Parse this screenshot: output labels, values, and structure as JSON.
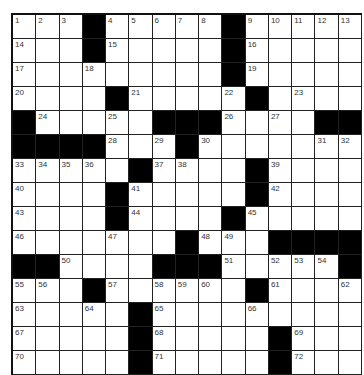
{
  "puzzle": {
    "rows": 15,
    "cols": 15,
    "colors": {
      "block": "#000000",
      "cell": "#ffffff",
      "line": "#222222",
      "number": "#333333"
    },
    "layout": [
      "...#.....#.....",
      "...#.....#.....",
      ".........#.....",
      "....#.....#....",
      "#.....###....##",
      "####...#.......",
      ".....#....#....",
      "....#.....#....",
      "....#....#.....",
      ".......#...####",
      "##....###.....#",
      "...#......#....",
      ".....#.........",
      ".....#.....#...",
      ".....#.....#..."
    ],
    "numbers": [
      {
        "r": 0,
        "c": 0,
        "n": "1"
      },
      {
        "r": 0,
        "c": 1,
        "n": "2"
      },
      {
        "r": 0,
        "c": 2,
        "n": "3"
      },
      {
        "r": 0,
        "c": 4,
        "n": "4"
      },
      {
        "r": 0,
        "c": 5,
        "n": "5"
      },
      {
        "r": 0,
        "c": 6,
        "n": "6"
      },
      {
        "r": 0,
        "c": 7,
        "n": "7"
      },
      {
        "r": 0,
        "c": 8,
        "n": "8"
      },
      {
        "r": 0,
        "c": 10,
        "n": "9"
      },
      {
        "r": 0,
        "c": 11,
        "n": "10"
      },
      {
        "r": 0,
        "c": 12,
        "n": "11"
      },
      {
        "r": 0,
        "c": 13,
        "n": "12"
      },
      {
        "r": 0,
        "c": 14,
        "n": "13"
      },
      {
        "r": 1,
        "c": 0,
        "n": "14"
      },
      {
        "r": 1,
        "c": 4,
        "n": "15"
      },
      {
        "r": 1,
        "c": 10,
        "n": "16"
      },
      {
        "r": 2,
        "c": 0,
        "n": "17"
      },
      {
        "r": 2,
        "c": 3,
        "n": "18"
      },
      {
        "r": 2,
        "c": 10,
        "n": "19"
      },
      {
        "r": 3,
        "c": 0,
        "n": "20"
      },
      {
        "r": 3,
        "c": 5,
        "n": "21"
      },
      {
        "r": 3,
        "c": 9,
        "n": "22"
      },
      {
        "r": 3,
        "c": 12,
        "n": "23"
      },
      {
        "r": 4,
        "c": 1,
        "n": "24"
      },
      {
        "r": 4,
        "c": 4,
        "n": "25"
      },
      {
        "r": 4,
        "c": 9,
        "n": "26"
      },
      {
        "r": 4,
        "c": 11,
        "n": "27"
      },
      {
        "r": 5,
        "c": 4,
        "n": "28"
      },
      {
        "r": 5,
        "c": 6,
        "n": "29"
      },
      {
        "r": 5,
        "c": 8,
        "n": "30"
      },
      {
        "r": 5,
        "c": 13,
        "n": "31"
      },
      {
        "r": 5,
        "c": 14,
        "n": "32"
      },
      {
        "r": 6,
        "c": 0,
        "n": "33"
      },
      {
        "r": 6,
        "c": 1,
        "n": "34"
      },
      {
        "r": 6,
        "c": 2,
        "n": "35"
      },
      {
        "r": 6,
        "c": 3,
        "n": "36"
      },
      {
        "r": 6,
        "c": 6,
        "n": "37"
      },
      {
        "r": 6,
        "c": 7,
        "n": "38"
      },
      {
        "r": 6,
        "c": 11,
        "n": "39"
      },
      {
        "r": 7,
        "c": 0,
        "n": "40"
      },
      {
        "r": 7,
        "c": 5,
        "n": "41"
      },
      {
        "r": 7,
        "c": 11,
        "n": "42"
      },
      {
        "r": 8,
        "c": 0,
        "n": "43"
      },
      {
        "r": 8,
        "c": 5,
        "n": "44"
      },
      {
        "r": 8,
        "c": 10,
        "n": "45"
      },
      {
        "r": 9,
        "c": 0,
        "n": "46"
      },
      {
        "r": 9,
        "c": 4,
        "n": "47"
      },
      {
        "r": 9,
        "c": 8,
        "n": "48"
      },
      {
        "r": 9,
        "c": 9,
        "n": "49"
      },
      {
        "r": 10,
        "c": 2,
        "n": "50"
      },
      {
        "r": 10,
        "c": 9,
        "n": "51"
      },
      {
        "r": 10,
        "c": 11,
        "n": "52"
      },
      {
        "r": 10,
        "c": 12,
        "n": "53"
      },
      {
        "r": 10,
        "c": 13,
        "n": "54"
      },
      {
        "r": 11,
        "c": 0,
        "n": "55"
      },
      {
        "r": 11,
        "c": 1,
        "n": "56"
      },
      {
        "r": 11,
        "c": 4,
        "n": "57"
      },
      {
        "r": 11,
        "c": 6,
        "n": "58"
      },
      {
        "r": 11,
        "c": 7,
        "n": "59"
      },
      {
        "r": 11,
        "c": 8,
        "n": "60"
      },
      {
        "r": 11,
        "c": 11,
        "n": "61"
      },
      {
        "r": 11,
        "c": 14,
        "n": "62"
      },
      {
        "r": 12,
        "c": 0,
        "n": "63"
      },
      {
        "r": 12,
        "c": 3,
        "n": "64"
      },
      {
        "r": 12,
        "c": 6,
        "n": "65"
      },
      {
        "r": 12,
        "c": 10,
        "n": "66"
      },
      {
        "r": 13,
        "c": 0,
        "n": "67"
      },
      {
        "r": 13,
        "c": 6,
        "n": "68"
      },
      {
        "r": 13,
        "c": 12,
        "n": "69"
      },
      {
        "r": 14,
        "c": 0,
        "n": "70"
      },
      {
        "r": 14,
        "c": 6,
        "n": "71"
      },
      {
        "r": 14,
        "c": 12,
        "n": "72"
      }
    ]
  }
}
